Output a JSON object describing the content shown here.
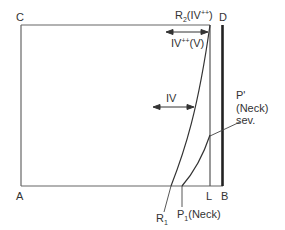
{
  "diagram": {
    "corners": {
      "C": "C",
      "D": "D",
      "A": "A",
      "B": "B",
      "L": "L"
    },
    "labels": {
      "r2_main": "R",
      "r2_sub": "2",
      "r2_paren_open": "(IV",
      "r2_sup": "++",
      "r2_paren_close": ")",
      "iv_pp_main": "IV",
      "iv_pp_sup": "++",
      "iv_pp_tail": "(V)",
      "iv": "IV",
      "p_prime": "P'",
      "p_prime_neck": "(Neck)",
      "p_prime_sev": "sev.",
      "r1_main": "R",
      "r1_sub": "1",
      "p1_main": "P",
      "p1_sub": "1",
      "p1_tail": "(Neck)"
    },
    "colors": {
      "line": "#555555",
      "thick": "#222222",
      "text": "#333333"
    }
  }
}
